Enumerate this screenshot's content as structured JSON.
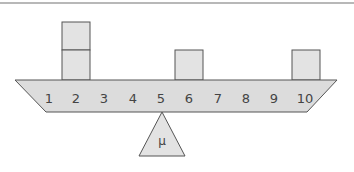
{
  "diagram": {
    "scale_labels": [
      "1",
      "2",
      "3",
      "4",
      "5",
      "6",
      "7",
      "8",
      "9",
      "10"
    ],
    "fulcrum_label": "μ",
    "blocks": [
      {
        "position": 2,
        "count": 2
      },
      {
        "position": 6,
        "count": 1
      },
      {
        "position": 10,
        "count": 1
      }
    ],
    "colors": {
      "fill": "#e0e0e0",
      "stroke": "#555555",
      "rule": "#999999"
    }
  }
}
